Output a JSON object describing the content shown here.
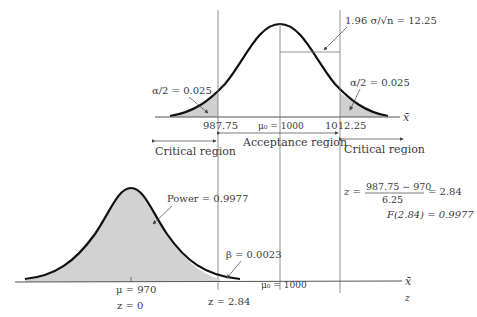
{
  "top_panel": {
    "alpha_left_label": "α/2 = 0.025",
    "alpha_right_label": "α/2 = 0.025",
    "se_label": "1.96 σ/√n = 12.25",
    "lower_critical_value": "987.75",
    "mu0_label": "μ₀ = 1000",
    "upper_critical_value": "1012.25",
    "axis_label": "x̄",
    "critical_region_left": "Critical region",
    "acceptance_region": "Acceptance region",
    "critical_region_right": "Critical region"
  },
  "bottom_panel": {
    "power_label": "Power = 0.9977",
    "beta_label": "β = 0.0023",
    "mu_label": "μ = 970",
    "z0_label": "z = 0",
    "z_crit_label": "z = 2.84",
    "mu0_label": "μ₀ = 1000",
    "axis_label_xbar": "x̄",
    "axis_label_z": "z"
  },
  "equations": {
    "z_prefix": "z =",
    "z_numerator": "987.75 − 970",
    "z_denominator": "6.25",
    "z_result": "= 2.84",
    "cdf": "F(2.84) = 0.9977"
  },
  "colors": {
    "curve": "#111111",
    "shade": "#cfcfcf",
    "lines": "#555555",
    "text": "#3a3a3a"
  }
}
